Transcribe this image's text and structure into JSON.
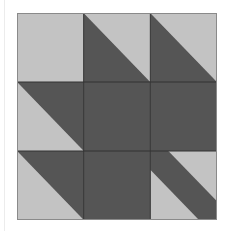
{
  "diagram": {
    "type": "quilt-block",
    "pattern": "maple-leaf",
    "grid": {
      "rows": 3,
      "cols": 3
    },
    "colors": {
      "light": "#c3c3c3",
      "dark": "#555555",
      "seam": "#333333",
      "border": "#8a8a8a"
    },
    "cells": [
      {
        "row": 0,
        "col": 0,
        "kind": "solid",
        "fill": "light"
      },
      {
        "row": 0,
        "col": 1,
        "kind": "half-square-triangle",
        "diagonal": "tl-br",
        "dark_side": "lower-left"
      },
      {
        "row": 0,
        "col": 2,
        "kind": "half-square-triangle",
        "diagonal": "tl-br",
        "dark_side": "lower-left"
      },
      {
        "row": 1,
        "col": 0,
        "kind": "half-square-triangle",
        "diagonal": "tl-br",
        "dark_side": "upper-right"
      },
      {
        "row": 1,
        "col": 1,
        "kind": "solid",
        "fill": "dark"
      },
      {
        "row": 1,
        "col": 2,
        "kind": "solid",
        "fill": "dark"
      },
      {
        "row": 2,
        "col": 0,
        "kind": "half-square-triangle",
        "diagonal": "tl-br",
        "dark_side": "upper-right"
      },
      {
        "row": 2,
        "col": 1,
        "kind": "solid",
        "fill": "dark"
      },
      {
        "row": 2,
        "col": 2,
        "kind": "stem",
        "diagonal": "tl-br",
        "fill": "dark"
      }
    ]
  }
}
